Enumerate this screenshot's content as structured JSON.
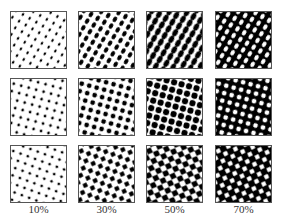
{
  "figure": {
    "columns": [
      {
        "label": "10%",
        "coverage": 0.1
      },
      {
        "label": "30%",
        "coverage": 0.3
      },
      {
        "label": "50%",
        "coverage": 0.5
      },
      {
        "label": "70%",
        "coverage": 0.7
      }
    ],
    "rows": [
      {
        "dot_shape": "elliptical",
        "angle": 30
      },
      {
        "dot_shape": "round",
        "angle": 15
      },
      {
        "dot_shape": "square",
        "angle": 20
      }
    ],
    "colors": {
      "ink": "#000000",
      "paper": "#ffffff",
      "border": "#555555"
    }
  }
}
